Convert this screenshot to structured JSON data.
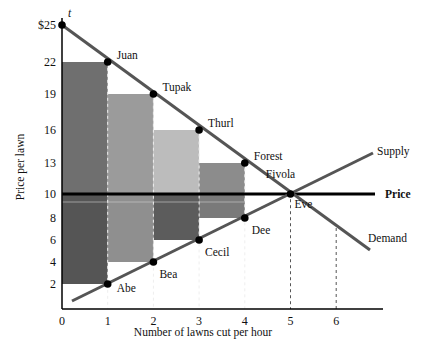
{
  "chart_data": {
    "type": "line",
    "title": "",
    "xlabel": "Number of lawns cut per hour",
    "ylabel": "Price per lawn",
    "x_ticks": [
      "0",
      "1",
      "2",
      "3",
      "4",
      "5",
      "6"
    ],
    "y_ticks": [
      "2",
      "4",
      "6",
      "8",
      "10",
      "13",
      "16",
      "19",
      "22",
      "$25"
    ],
    "xlim": [
      0,
      6.8
    ],
    "ylim": [
      0,
      25
    ],
    "grid": false,
    "price": 10,
    "price_label": "Price",
    "series": [
      {
        "name": "Demand",
        "label": "Demand",
        "points": [
          {
            "x": 0,
            "y": 25,
            "label": "t"
          },
          {
            "x": 1,
            "y": 22,
            "label": "Juan"
          },
          {
            "x": 2,
            "y": 19,
            "label": "Tupak"
          },
          {
            "x": 3,
            "y": 16,
            "label": "Thurl"
          },
          {
            "x": 4,
            "y": 13,
            "label": "Forest"
          },
          {
            "x": 5,
            "y": 10,
            "label": "Fivola"
          }
        ],
        "extends_to": {
          "x": 6.7,
          "y": 5
        }
      },
      {
        "name": "Supply",
        "label": "Supply",
        "points": [
          {
            "x": 1,
            "y": 2,
            "label": "Abe"
          },
          {
            "x": 2,
            "y": 4,
            "label": "Bea"
          },
          {
            "x": 3,
            "y": 6,
            "label": "Cecil"
          },
          {
            "x": 4,
            "y": 8,
            "label": "Dee"
          },
          {
            "x": 5,
            "y": 10,
            "label": "Eve"
          }
        ],
        "starts_at": {
          "x": 0.2,
          "y": 0.6
        },
        "extends_to": {
          "x": 6.8,
          "y": 13.4
        }
      }
    ],
    "consumer_surplus_bars": [
      {
        "x0": 0,
        "x1": 1,
        "top": 22,
        "bottom": 10,
        "color": "#6f6f6f"
      },
      {
        "x0": 1,
        "x1": 2,
        "top": 19,
        "bottom": 10,
        "color": "#9b9b9b"
      },
      {
        "x0": 2,
        "x1": 3,
        "top": 16,
        "bottom": 10,
        "color": "#bcbcbc"
      },
      {
        "x0": 3,
        "x1": 4,
        "top": 13,
        "bottom": 10,
        "color": "#8c8c8c"
      }
    ],
    "producer_surplus_bars": [
      {
        "x0": 0,
        "x1": 1,
        "top": 10,
        "bottom": 2,
        "color": "#555555"
      },
      {
        "x0": 1,
        "x1": 2,
        "top": 10,
        "bottom": 4,
        "color": "#8f8f8f"
      },
      {
        "x0": 2,
        "x1": 3,
        "top": 10,
        "bottom": 6,
        "color": "#5c5c5c"
      },
      {
        "x0": 3,
        "x1": 4,
        "top": 10,
        "bottom": 8,
        "color": "#7a7a7a"
      }
    ],
    "dashed_verticals": [
      1,
      2,
      3,
      4,
      5,
      6
    ],
    "colors": {
      "demand_line": "#555555",
      "supply_line": "#555555",
      "price_line": "#000000",
      "points": "#000000"
    }
  }
}
